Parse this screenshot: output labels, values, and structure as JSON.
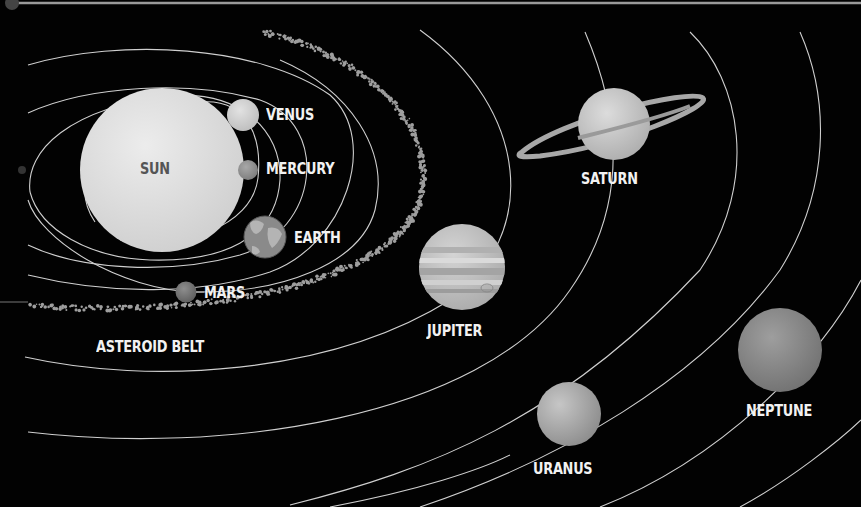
{
  "diagram": {
    "background_color": "#020202",
    "orbit_color": "#cfcfcf",
    "label_color": "#f2f2f2",
    "bodies": [
      {
        "id": "sun",
        "label": "SUN",
        "shade": "#dedede"
      },
      {
        "id": "mercury",
        "label": "MERCURY",
        "shade": "#8c8c8c"
      },
      {
        "id": "venus",
        "label": "VENUS",
        "shade": "#d2d2d2"
      },
      {
        "id": "earth",
        "label": "EARTH",
        "shade": "#9a9a9a"
      },
      {
        "id": "mars",
        "label": "MARS",
        "shade": "#777777"
      },
      {
        "id": "asteroid-belt",
        "label": "ASTEROID BELT",
        "shade": "#9e9e9e"
      },
      {
        "id": "jupiter",
        "label": "JUPITER",
        "shade": "#c4c4c4"
      },
      {
        "id": "saturn",
        "label": "SATURN",
        "shade": "#c8c8c8"
      },
      {
        "id": "uranus",
        "label": "URANUS",
        "shade": "#b4b4b4"
      },
      {
        "id": "neptune",
        "label": "NEPTUNE",
        "shade": "#8e8e8e"
      }
    ],
    "order_from_sun": [
      "MERCURY",
      "VENUS",
      "EARTH",
      "MARS",
      "ASTEROID BELT",
      "JUPITER",
      "SATURN",
      "URANUS",
      "NEPTUNE"
    ]
  }
}
